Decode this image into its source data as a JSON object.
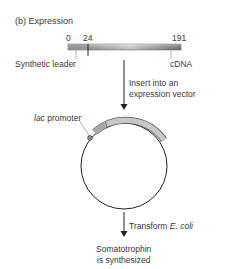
{
  "title": "(b) Expression",
  "gene_bar": {
    "ticks": [
      "0",
      "24",
      "191"
    ],
    "left_label": "Synthetic leader",
    "right_label": "cDNA"
  },
  "step1": {
    "line1": "Insert into an",
    "line2": "expression vector"
  },
  "plasmid": {
    "promoter_italic": "lac",
    "promoter_label": " promoter"
  },
  "step2": {
    "prefix": "Transform ",
    "italic": "E. coli"
  },
  "result": {
    "line1": "Somatotrophin",
    "line2": "is synthesized"
  },
  "colors": {
    "bar_dark": "#7a7a7a",
    "bar_light": "#e4e4e4",
    "line": "#222222",
    "text": "#3a3a3a"
  }
}
